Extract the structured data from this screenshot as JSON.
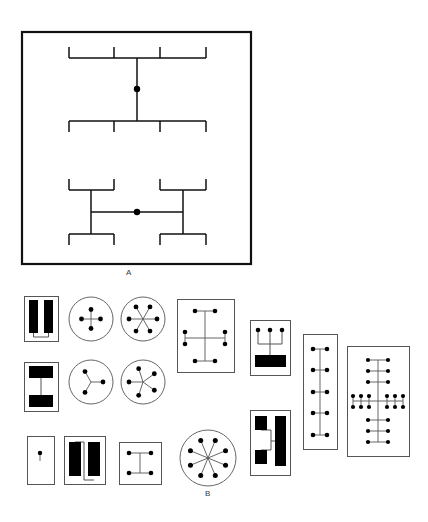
{
  "figure": {
    "background_color": "#ffffff",
    "ink_color": "#111111",
    "fill_color": "#000000",
    "thin_line_color": "#555555",
    "width": 428,
    "height": 522
  },
  "panels": [
    {
      "id": "panel-a",
      "label": "A",
      "label_x": 129,
      "label_y": 268,
      "frame": {
        "x": 22,
        "y": 32,
        "w": 229,
        "h": 232,
        "stroke_width": 2.2
      },
      "description": "Large bordered schematic with two hierarchical bracket trees, each with a filled hub node",
      "trees": [
        {
          "name": "upper-vertical-tree",
          "orientation": "vertical",
          "hub": {
            "x": 137,
            "y": 89,
            "r": 3.2
          },
          "spine": {
            "x1": 137,
            "y1": 58,
            "x2": 137,
            "y2": 121
          },
          "branches": [
            {
              "name": "top-bracket",
              "bar_y": 58,
              "bar_x1": 69,
              "bar_x2": 206,
              "tick_dir": "up",
              "tick_len": 11,
              "tick_xs": [
                69,
                114,
                160,
                206
              ]
            },
            {
              "name": "bottom-bracket",
              "bar_y": 121,
              "bar_x1": 69,
              "bar_x2": 206,
              "tick_dir": "down",
              "tick_len": 11,
              "tick_xs": [
                69,
                114,
                160,
                206
              ]
            }
          ]
        },
        {
          "name": "lower-horizontal-tree",
          "orientation": "horizontal",
          "hub": {
            "x": 137,
            "y": 212,
            "r": 3.2
          },
          "spine": {
            "x1": 91,
            "y1": 212,
            "x2": 183,
            "y2": 212
          },
          "branches": [
            {
              "name": "left-upper-bracket",
              "bar_y": 190,
              "bar_x1": 69,
              "bar_x2": 114,
              "tick_dir": "up",
              "tick_len": 11,
              "tick_xs": [
                69,
                114
              ],
              "stem": {
                "x": 91,
                "y1": 190,
                "y2": 212
              }
            },
            {
              "name": "right-upper-bracket",
              "bar_y": 190,
              "bar_x1": 160,
              "bar_x2": 206,
              "tick_dir": "up",
              "tick_len": 11,
              "tick_xs": [
                160,
                206
              ],
              "stem": {
                "x": 183,
                "y1": 190,
                "y2": 212
              }
            },
            {
              "name": "left-lower-bracket",
              "bar_y": 234,
              "bar_x1": 69,
              "bar_x2": 114,
              "tick_dir": "down",
              "tick_len": 11,
              "tick_xs": [
                69,
                114
              ],
              "stem": {
                "x": 91,
                "y1": 212,
                "y2": 234
              }
            },
            {
              "name": "right-lower-bracket",
              "bar_y": 234,
              "bar_x1": 160,
              "bar_x2": 206,
              "tick_dir": "down",
              "tick_len": 11,
              "tick_xs": [
                160,
                206
              ],
              "stem": {
                "x": 183,
                "y1": 212,
                "y2": 234
              }
            }
          ]
        }
      ]
    },
    {
      "id": "panel-b",
      "label": "B",
      "label_x": 208,
      "label_y": 489,
      "description": "Grid of fifteen small schematic variants: filled-bar blocks, radial star graphs, and bracket-tree arrays"
    }
  ],
  "panel_b_items": [
    {
      "id": "b-bars-double-vertical",
      "name": "double-bar-block",
      "type": "bar-block",
      "x": 22,
      "y": 294,
      "w": 34,
      "h": 45,
      "bars": [
        {
          "x": 5,
          "y": 4,
          "w": 9,
          "h": 33
        },
        {
          "x": 20,
          "y": 4,
          "w": 9,
          "h": 33
        }
      ],
      "connector": {
        "x1": 9.5,
        "y1": 37,
        "x2": 9.5,
        "y2": 41,
        "x3": 24.5,
        "y3": 41,
        "x4": 24.5,
        "y4": 37
      }
    },
    {
      "id": "b-star-4",
      "name": "radial-star-4",
      "type": "star",
      "x": 66,
      "y": 294,
      "cx": 23,
      "cy": 23,
      "r": 22,
      "node_count": 4,
      "node_radius": 9.5,
      "dot_r": 2.4,
      "angles": [
        0,
        90,
        180,
        270
      ]
    },
    {
      "id": "b-star-6",
      "name": "radial-star-6",
      "type": "star",
      "x": 118,
      "y": 294,
      "cx": 23,
      "cy": 23,
      "r": 22,
      "node_count": 6,
      "node_radius": 14,
      "dot_r": 2.4,
      "angles": [
        30,
        90,
        150,
        210,
        270,
        330
      ]
    },
    {
      "id": "b-tree-mirror",
      "name": "bracket-tree-mirror",
      "type": "tree-box",
      "x": 175,
      "y": 297,
      "w": 57,
      "h": 73,
      "dot_r": 2.3,
      "spine": {
        "x1": 28,
        "y1": 12,
        "x2": 28,
        "y2": 62
      },
      "rows": [
        {
          "y": 12,
          "xs": [
            18,
            38
          ]
        },
        {
          "y": 33,
          "xs": [
            8,
            48
          ]
        },
        {
          "y": 45,
          "xs": [
            8,
            48
          ]
        },
        {
          "y": 62,
          "xs": [
            18,
            38
          ]
        }
      ],
      "hbars": [
        {
          "y": 12,
          "x1": 18,
          "x2": 38
        },
        {
          "y": 39,
          "x1": 8,
          "x2": 48
        },
        {
          "y": 62,
          "x1": 18,
          "x2": 38
        }
      ],
      "stems": [
        {
          "x": 8,
          "y1": 33,
          "y2": 45
        },
        {
          "x": 48,
          "y1": 33,
          "y2": 45
        }
      ]
    },
    {
      "id": "b-three-to-bar",
      "name": "three-dots-to-bar",
      "type": "dots-bar",
      "x": 248,
      "y": 318,
      "w": 40,
      "h": 55,
      "dot_r": 2.3,
      "dots": [
        {
          "x": 8,
          "y": 10
        },
        {
          "x": 20,
          "y": 10
        },
        {
          "x": 32,
          "y": 10
        }
      ],
      "bar": {
        "x": 5,
        "y": 35,
        "w": 31,
        "h": 12
      },
      "links": [
        {
          "x1": 8,
          "y1": 10,
          "x2": 8,
          "y2": 24,
          "x3": 32,
          "y3": 24,
          "x4": 32,
          "y4": 10
        },
        {
          "x1": 20,
          "y1": 10,
          "x2": 20,
          "y2": 41
        }
      ]
    },
    {
      "id": "b-bars-stacked",
      "name": "stacked-bar-block",
      "type": "bar-block",
      "x": 22,
      "y": 360,
      "w": 34,
      "h": 49,
      "bars": [
        {
          "x": 5,
          "y": 4,
          "w": 24,
          "h": 12
        },
        {
          "x": 5,
          "y": 33,
          "w": 24,
          "h": 12
        }
      ],
      "connector": {
        "x1": 17,
        "y1": 16,
        "x2": 17,
        "y2": 33
      }
    },
    {
      "id": "b-star-3",
      "name": "radial-star-3",
      "type": "star",
      "x": 66,
      "y": 357,
      "cx": 23,
      "cy": 23,
      "r": 22,
      "node_count": 3,
      "node_radius": 12,
      "dot_r": 2.4,
      "angles": [
        90,
        210,
        330
      ]
    },
    {
      "id": "b-star-5",
      "name": "radial-star-5",
      "type": "star",
      "x": 118,
      "y": 357,
      "cx": 23,
      "cy": 23,
      "r": 22,
      "node_count": 5,
      "node_radius": 14,
      "dot_r": 2.4,
      "angles": [
        54,
        126,
        198,
        270,
        342
      ]
    },
    {
      "id": "b-bars-L",
      "name": "L-bar-block",
      "type": "bar-block-complex",
      "x": 248,
      "y": 408,
      "w": 40,
      "h": 65,
      "bars": [
        {
          "x": 5,
          "y": 6,
          "w": 12,
          "h": 14
        },
        {
          "x": 5,
          "y": 40,
          "w": 12,
          "h": 14
        },
        {
          "x": 25,
          "y": 6,
          "w": 11,
          "h": 50
        }
      ],
      "links": [
        {
          "x1": 11,
          "y1": 20,
          "x2": 21,
          "y2": 20,
          "x3": 21,
          "y3": 31,
          "x4": 25,
          "y4": 31
        },
        {
          "x1": 11,
          "y1": 40,
          "x2": 21,
          "y2": 40,
          "x3": 21,
          "y3": 31
        }
      ]
    },
    {
      "id": "b-ladder-5",
      "name": "ladder-array-5",
      "type": "ladder",
      "x": 301,
      "y": 332,
      "w": 34,
      "h": 115,
      "dot_r": 2.3,
      "spine": {
        "x": 17,
        "y1": 15,
        "y2": 101
      },
      "rungs": [
        {
          "y": 15,
          "xs": [
            10,
            24
          ]
        },
        {
          "y": 36,
          "xs": [
            10,
            24
          ]
        },
        {
          "y": 58,
          "xs": [
            10,
            24
          ]
        },
        {
          "y": 79,
          "xs": [
            10,
            24
          ]
        },
        {
          "y": 101,
          "xs": [
            10,
            24
          ]
        }
      ]
    },
    {
      "id": "b-tree-dense",
      "name": "dense-bracket-tree",
      "type": "tree-box-dense",
      "x": 345,
      "y": 344,
      "w": 62,
      "h": 110,
      "dot_r": 2.1,
      "spine": {
        "x": 31,
        "y1": 14,
        "y2": 96
      },
      "top_rows": [
        {
          "y": 14,
          "xs": [
            21,
            41
          ]
        },
        {
          "y": 25,
          "xs": [
            21,
            41
          ]
        },
        {
          "y": 36,
          "xs": [
            21,
            41
          ]
        }
      ],
      "top_bars": [
        {
          "y": 14,
          "x1": 21,
          "x2": 41
        },
        {
          "y": 25,
          "x1": 21,
          "x2": 41
        },
        {
          "y": 36,
          "x1": 21,
          "x2": 41
        }
      ],
      "mid_rows": [
        {
          "y": 50,
          "xs": [
            6,
            14,
            22,
            40,
            48,
            56
          ]
        },
        {
          "y": 61,
          "xs": [
            6,
            14,
            22,
            40,
            48,
            56
          ]
        }
      ],
      "mid_bars": [
        {
          "y": 55,
          "x1": 6,
          "x2": 56
        }
      ],
      "mid_stems": [
        {
          "x": 6,
          "y1": 50,
          "y2": 61
        },
        {
          "x": 14,
          "y1": 50,
          "y2": 61
        },
        {
          "x": 22,
          "y1": 50,
          "y2": 61
        },
        {
          "x": 40,
          "y1": 50,
          "y2": 61
        },
        {
          "x": 48,
          "y1": 50,
          "y2": 61
        },
        {
          "x": 56,
          "y1": 50,
          "y2": 61
        }
      ],
      "bottom_rows": [
        {
          "y": 74,
          "xs": [
            21,
            41
          ]
        },
        {
          "y": 85,
          "xs": [
            21,
            41
          ]
        },
        {
          "y": 96,
          "xs": [
            21,
            41
          ]
        }
      ],
      "bottom_bars": [
        {
          "y": 74,
          "x1": 21,
          "x2": 41
        },
        {
          "y": 85,
          "x1": 21,
          "x2": 41
        },
        {
          "y": 96,
          "x1": 21,
          "x2": 41
        }
      ]
    },
    {
      "id": "b-single-dot",
      "name": "single-node-box",
      "type": "dot-box",
      "x": 25,
      "y": 434,
      "w": 27,
      "h": 48,
      "dot_r": 2.2,
      "dots": [
        {
          "x": 13,
          "y": 17
        }
      ],
      "stub": {
        "x": 13,
        "y1": 19,
        "y2": 25
      }
    },
    {
      "id": "b-bars-pair-tall",
      "name": "tall-pair-bar-block",
      "type": "bar-block",
      "x": 62,
      "y": 434,
      "w": 41,
      "h": 48,
      "bars": [
        {
          "x": 5,
          "y": 6,
          "w": 12,
          "h": 34
        },
        {
          "x": 24,
          "y": 6,
          "w": 12,
          "h": 34
        }
      ],
      "connector": {
        "x1": 11,
        "y1": 6,
        "x2": 20,
        "y2": 6,
        "x3": 20,
        "y3": 44,
        "x4": 30,
        "y4": 44
      }
    },
    {
      "id": "b-h-graph",
      "name": "h-bracket-box",
      "type": "tree-box",
      "x": 117,
      "y": 440,
      "w": 42,
      "h": 42,
      "dot_r": 2.3,
      "spine": {
        "x1": 21,
        "y1": 11,
        "x2": 21,
        "y2": 31
      },
      "rows": [
        {
          "y": 11,
          "xs": [
            10,
            32
          ]
        },
        {
          "y": 31,
          "xs": [
            10,
            32
          ]
        }
      ],
      "hbars": [
        {
          "y": 11,
          "x1": 10,
          "x2": 32
        },
        {
          "y": 31,
          "x1": 10,
          "x2": 32
        }
      ],
      "stems": []
    },
    {
      "id": "b-star-8",
      "name": "radial-star-8",
      "type": "star",
      "x": 177,
      "y": 427,
      "cx": 29,
      "cy": 29,
      "r": 28,
      "node_count": 8,
      "node_radius": 19,
      "dot_r": 2.5,
      "angles": [
        22.5,
        67.5,
        112.5,
        157.5,
        202.5,
        247.5,
        292.5,
        337.5
      ]
    }
  ]
}
